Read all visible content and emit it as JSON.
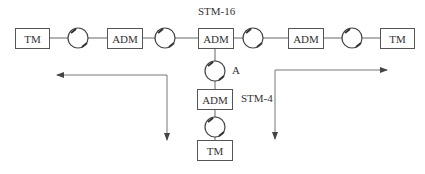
{
  "diagram": {
    "type": "network-topology",
    "nodes": {
      "tm_left": "TM",
      "adm_left": "ADM",
      "adm_center": "ADM",
      "adm_right": "ADM",
      "tm_right": "TM",
      "adm_lower": "ADM",
      "tm_bottom": "TM"
    },
    "labels": {
      "stm16": "STM-16",
      "stm4": "STM-4",
      "point_a": "A"
    },
    "regenerators": [
      "regenerator-1",
      "regenerator-2",
      "regenerator-3",
      "regenerator-4",
      "regenerator-A",
      "regenerator-bottom"
    ],
    "arrows": [
      {
        "name": "left-flow",
        "from": "vertical-down",
        "directions": [
          "left",
          "down"
        ]
      },
      {
        "name": "right-flow",
        "directions": [
          "right",
          "down"
        ]
      }
    ],
    "colors": {
      "line": "#555555",
      "text": "#333333",
      "background": "#ffffff"
    }
  }
}
